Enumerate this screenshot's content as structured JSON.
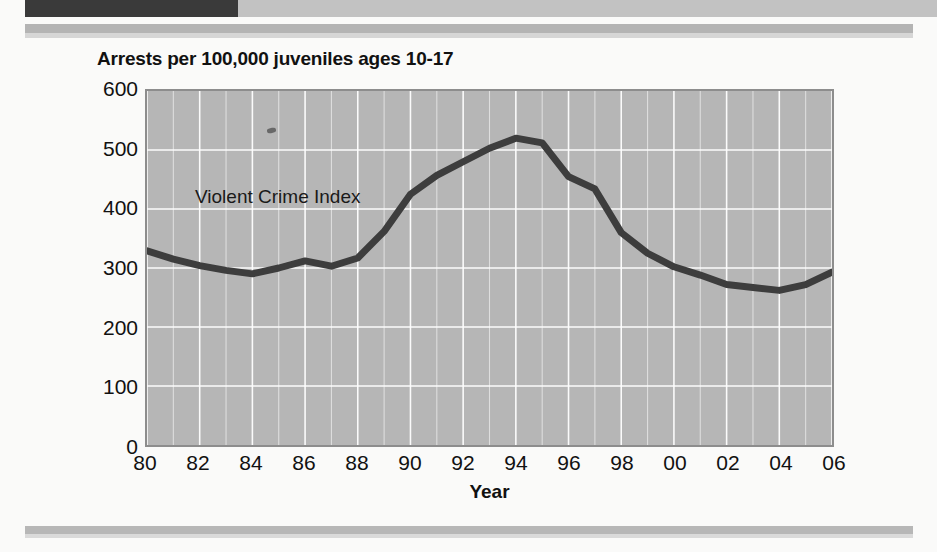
{
  "page": {
    "background_color": "#fafaf9",
    "bands": {
      "top_dark_bar_color": "#3a3a3a",
      "top_light_bar_color": "#c2c2c2",
      "rule_color": "#b4b4b4"
    }
  },
  "chart_data": {
    "type": "line",
    "title": "Arrests per 100,000 juveniles ages 10-17",
    "xlabel": "Year",
    "ylabel": "",
    "xlim": [
      1980,
      2006
    ],
    "ylim": [
      0,
      600
    ],
    "grid": true,
    "legend_position": "inline-annotation",
    "plot_background_color": "#b6b6b6",
    "gridline_color": "#ffffff",
    "line_color": "#3d3d3d",
    "y_ticks": [
      0,
      100,
      200,
      300,
      400,
      500,
      600
    ],
    "y_tick_labels": [
      "0",
      "100",
      "200",
      "300",
      "400",
      "500",
      "600"
    ],
    "x_ticks": [
      1980,
      1982,
      1984,
      1986,
      1988,
      1990,
      1992,
      1994,
      1996,
      1998,
      2000,
      2002,
      2004,
      2006
    ],
    "x_tick_labels": [
      "80",
      "82",
      "84",
      "86",
      "88",
      "90",
      "92",
      "94",
      "96",
      "98",
      "00",
      "02",
      "04",
      "06"
    ],
    "annotations": [
      {
        "text": "Violent Crime Index",
        "x": 1982.0,
        "y": 430
      }
    ],
    "series": [
      {
        "name": "Violent Crime Index",
        "x": [
          1980,
          1981,
          1982,
          1983,
          1984,
          1985,
          1986,
          1987,
          1988,
          1989,
          1990,
          1991,
          1992,
          1993,
          1994,
          1995,
          1996,
          1997,
          1998,
          1999,
          2000,
          2001,
          2002,
          2003,
          2004,
          2005,
          2006
        ],
        "values": [
          329,
          315,
          304,
          296,
          290,
          300,
          312,
          303,
          317,
          362,
          425,
          457,
          480,
          503,
          520,
          512,
          455,
          434,
          360,
          325,
          302,
          288,
          272,
          267,
          262,
          272,
          293
        ]
      }
    ]
  }
}
